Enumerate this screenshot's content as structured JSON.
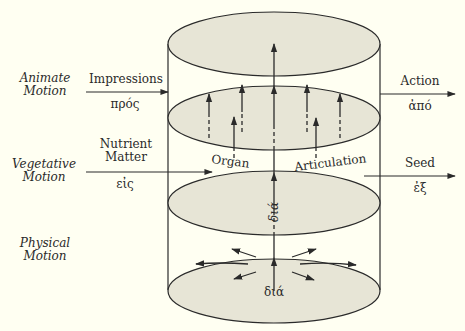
{
  "levels": {
    "animate": {
      "line1": "Animate",
      "line2": "Motion"
    },
    "vegetative": {
      "line1": "Vegetative",
      "line2": "Motion"
    },
    "physical": {
      "line1": "Physical",
      "line2": "Motion"
    }
  },
  "inputs": {
    "impressions": {
      "label": "Impressions",
      "greek": "πρός"
    },
    "nutrient": {
      "line1": "Nutrient",
      "line2": "Matter",
      "greek": "εἰς"
    }
  },
  "outputs": {
    "action": {
      "label": "Action",
      "greek": "ἀπό"
    },
    "seed": {
      "label": "Seed",
      "greek": "ἐξ"
    }
  },
  "middle_labels": {
    "organ": "Organ",
    "articulation": "Articulation",
    "dia_vertical": "διά",
    "dia_bottom": "διά"
  },
  "colors": {
    "background": "#fffff2",
    "ellipse_fill": "#e7e5d6",
    "stroke": "#2a2a2a"
  }
}
